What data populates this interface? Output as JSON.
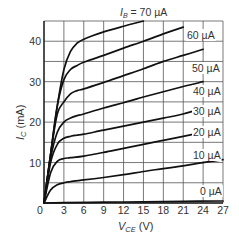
{
  "chart_data": {
    "type": "line",
    "title": "",
    "xlabel": "V_CE (V)",
    "ylabel": "I_C (mA)",
    "xlim": [
      0,
      27
    ],
    "ylim": [
      0,
      45
    ],
    "grid": true,
    "x_ticks": [
      0,
      3,
      6,
      9,
      12,
      15,
      18,
      21,
      24,
      27
    ],
    "y_ticks": [
      0,
      10,
      20,
      30,
      40
    ],
    "y_gridlines": [
      0,
      5,
      10,
      15,
      20,
      25,
      30,
      35,
      40,
      45
    ],
    "legend": "inline labels at curve ends",
    "series": [
      {
        "name": "I_B = 70 µA",
        "label": "I_B = 70 µA",
        "x": [
          0,
          1,
          2,
          3,
          4,
          5,
          6,
          9,
          12,
          15
        ],
        "y": [
          0,
          12,
          24,
          33,
          37.5,
          39.5,
          40.5,
          42.3,
          43.7,
          45
        ]
      },
      {
        "name": "60 µA",
        "label": "60 µA",
        "x": [
          0,
          1,
          2,
          3,
          4,
          5,
          6,
          9,
          12,
          15,
          18,
          21
        ],
        "y": [
          0,
          12,
          24,
          30.5,
          33,
          34,
          34.8,
          36.5,
          38.3,
          40,
          41.8,
          43.5
        ]
      },
      {
        "name": "50 µA",
        "label": "50 µA",
        "x": [
          0,
          1,
          2,
          3,
          4,
          5,
          6,
          9,
          12,
          15,
          18,
          21,
          24
        ],
        "y": [
          0,
          12,
          22,
          25,
          27,
          27.8,
          28.2,
          29.8,
          31.5,
          33.2,
          35,
          36.5,
          38
        ]
      },
      {
        "name": "40 µA",
        "label": "40 µA",
        "x": [
          0,
          1,
          2,
          3,
          4,
          5,
          6,
          9,
          12,
          15,
          18,
          21,
          24
        ],
        "y": [
          0,
          11,
          17.5,
          20,
          21,
          21.6,
          22,
          23.5,
          24.8,
          26.2,
          27.5,
          28.8,
          30
        ]
      },
      {
        "name": "30 µA",
        "label": "30 µA",
        "x": [
          0,
          1,
          2,
          3,
          4,
          5,
          6,
          9,
          12,
          15,
          18,
          21,
          24
        ],
        "y": [
          0,
          10,
          14.5,
          16,
          16.5,
          16.8,
          17,
          18,
          19,
          20,
          21,
          22,
          23.5
        ]
      },
      {
        "name": "20 µA",
        "label": "20 µA",
        "x": [
          0,
          1,
          2,
          3,
          4,
          6,
          9,
          12,
          15,
          18,
          21,
          24
        ],
        "y": [
          0,
          7.5,
          10.3,
          11,
          11.2,
          11.6,
          12.5,
          13.5,
          14.5,
          15.5,
          16.5,
          17.5
        ]
      },
      {
        "name": "10 µA",
        "label": "10 µA",
        "x": [
          0,
          1,
          2,
          3,
          4,
          6,
          9,
          12,
          15,
          18,
          21,
          24,
          27
        ],
        "y": [
          0,
          3.2,
          4.5,
          5,
          5.3,
          5.7,
          6.3,
          7,
          7.8,
          8.5,
          9.2,
          10,
          10.7
        ]
      },
      {
        "name": "0 µA",
        "label": "0 µA",
        "x": [
          0,
          3,
          9,
          15,
          21,
          27
        ],
        "y": [
          0,
          0.1,
          0.2,
          0.3,
          0.4,
          0.5
        ]
      }
    ]
  },
  "axes": {
    "x_title_main": "V",
    "x_title_sub": "CE",
    "x_title_unit": " (V)",
    "y_title_main": "I",
    "y_title_sub": "C",
    "y_title_unit": " (mA)"
  },
  "labels": {
    "ib_prefix": "I",
    "ib_sub": "B",
    "ib_70": " = 70 µA",
    "ib_60": "60 µA",
    "ib_50": "50 µA",
    "ib_40": "40 µA",
    "ib_30": "30 µA",
    "ib_20": "20 µA",
    "ib_10": "10 µA",
    "ib_0": "0 µA"
  },
  "ticks": {
    "x": [
      "0",
      "3",
      "6",
      "9",
      "12",
      "15",
      "18",
      "21",
      "24",
      "27"
    ],
    "y": [
      "10",
      "20",
      "30",
      "40"
    ]
  }
}
